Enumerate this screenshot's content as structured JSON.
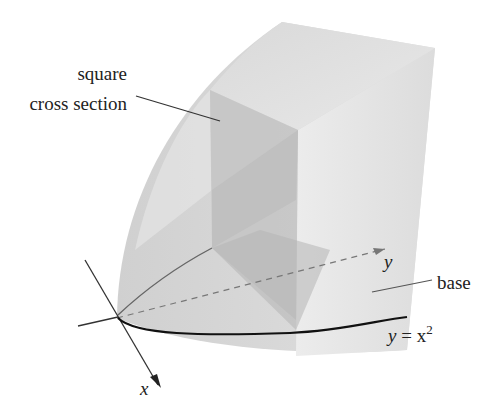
{
  "figure": {
    "labels": {
      "cross_section_line1": "square",
      "cross_section_line2": "cross section",
      "base": "base",
      "curve_y": "y",
      "curve_eq": " = x",
      "curve_exp": "2",
      "x_axis": "x",
      "y_axis": "y"
    },
    "colors": {
      "background": "#ffffff",
      "solid_light": "#e6e6e6",
      "solid_mid": "#d4d4d4",
      "solid_dark": "#bdbdbd",
      "cross_section": "#c2c2c2",
      "axis": "#333333",
      "curve": "#111111"
    }
  }
}
